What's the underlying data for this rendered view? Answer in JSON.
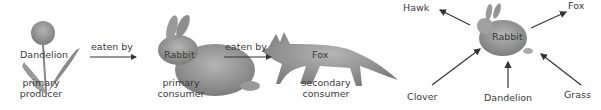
{
  "food_chain": {
    "nodes": [
      {
        "name": "Dandelion",
        "role_line1": "primary",
        "role_line2": "producer"
      },
      {
        "name": "Rabbit",
        "role_line1": "primary",
        "role_line2": "consumer"
      },
      {
        "name": "Fox",
        "role_line1": "secondary",
        "role_line2": "consumer"
      }
    ],
    "edges": [
      {
        "label": "eaten by"
      },
      {
        "label": "eaten by"
      }
    ]
  },
  "food_web": {
    "center": "Rabbit",
    "predators": [
      "Hawk",
      "Fox"
    ],
    "food_sources": [
      "Clover",
      "Dandelion",
      "Grass"
    ]
  },
  "colors": {
    "organism_fill": "#8c8c8c",
    "arrow": "#333333",
    "text": "#3a3a3a"
  }
}
